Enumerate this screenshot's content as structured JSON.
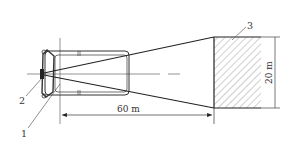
{
  "diagram": {
    "type": "headlight-beam-test-layout",
    "colors": {
      "line": "#222222",
      "thin_line": "#555555",
      "hatch": "#888888",
      "background": "#ffffff"
    },
    "labels": {
      "vehicle_part_1": "1",
      "headlamp_2": "2",
      "target_screen_3": "3"
    },
    "dimensions": {
      "distance": "60 m",
      "screen_height": "20 m"
    }
  }
}
